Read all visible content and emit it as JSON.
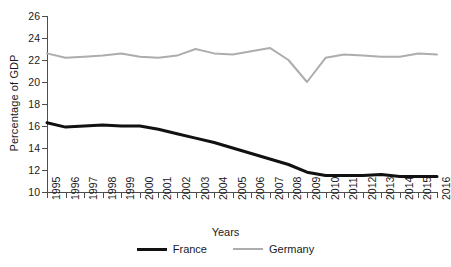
{
  "chart_data": {
    "type": "line",
    "title": "",
    "xlabel": "Years",
    "ylabel": "Percentage of GDP",
    "grid": false,
    "legend_position": "bottom",
    "xlim": [
      1995,
      2016
    ],
    "ylim": [
      10,
      26
    ],
    "ytick_step": 2,
    "yticks": [
      10,
      12,
      14,
      16,
      18,
      20,
      22,
      24,
      26
    ],
    "categories": [
      "1995",
      "1996",
      "1997",
      "1998",
      "1999",
      "2000",
      "2001",
      "2002",
      "2003",
      "2004",
      "2005",
      "2006",
      "2007",
      "2008",
      "2009",
      "2010",
      "2011",
      "2012",
      "2013",
      "2014",
      "2015",
      "2016"
    ],
    "series": [
      {
        "name": "France",
        "color": "#111111",
        "values": [
          16.3,
          15.9,
          16.0,
          16.1,
          16.0,
          16.0,
          15.7,
          15.3,
          14.9,
          14.5,
          14.0,
          13.5,
          13.0,
          12.5,
          11.8,
          11.5,
          11.5,
          11.5,
          11.6,
          11.4,
          11.4,
          11.4
        ]
      },
      {
        "name": "Germany",
        "color": "#adadad",
        "values": [
          22.6,
          22.2,
          22.3,
          22.4,
          22.6,
          22.3,
          22.2,
          22.4,
          23.0,
          22.6,
          22.5,
          22.8,
          23.1,
          22.0,
          20.0,
          22.2,
          22.5,
          22.4,
          22.3,
          22.3,
          22.6,
          22.5
        ]
      }
    ]
  },
  "legend": {
    "entries": [
      {
        "label": "France",
        "color": "#111111",
        "thickness": "thick"
      },
      {
        "label": "Germany",
        "color": "#adadad",
        "thickness": "thin"
      }
    ]
  }
}
